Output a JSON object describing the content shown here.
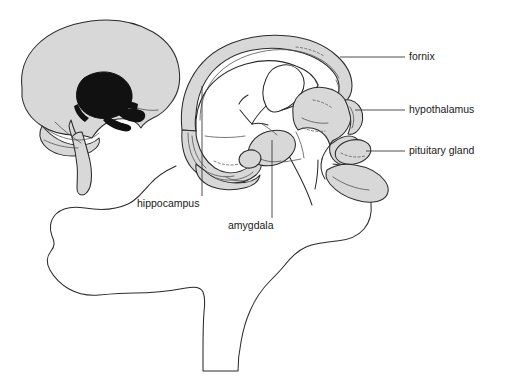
{
  "figure": {
    "background_color": "#ffffff",
    "width": 505,
    "height": 386,
    "shade_color": "#d8d8d8",
    "outline_color": "#2b2b2b",
    "leader_color": "#3a3a3a",
    "highlight_color": "#111111"
  },
  "labels": [
    {
      "id": "fornix",
      "text": "fornix",
      "x": 409,
      "y": 60,
      "leader_from_x": 340,
      "leader_from_y": 57,
      "leader_to_x": 405,
      "leader_to_y": 57
    },
    {
      "id": "hypothalamus",
      "text": "hypothalamus",
      "x": 409,
      "y": 113,
      "leader_from_x": 355,
      "leader_from_y": 110,
      "leader_to_x": 405,
      "leader_to_y": 110
    },
    {
      "id": "pituitary-gland",
      "text": "pituitary gland",
      "x": 409,
      "y": 154,
      "leader_from_x": 366,
      "leader_from_y": 151,
      "leader_to_x": 405,
      "leader_to_y": 151
    },
    {
      "id": "hippocampus",
      "text": "hippocampus",
      "x": 137,
      "y": 207,
      "leader_from_x": 202,
      "leader_from_y": 86,
      "leader_to_x": 202,
      "leader_to_y": 196
    },
    {
      "id": "amygdala",
      "text": "amygdala",
      "x": 228,
      "y": 229,
      "leader_from_x": 272,
      "leader_from_y": 140,
      "leader_to_x": 272,
      "leader_to_y": 218
    }
  ],
  "inset": {
    "id": "sagittal-brain-inset",
    "description": "small whole-brain sagittal silhouette with limbic ring highlighted in solid black"
  },
  "main": {
    "id": "limbic-system-detail",
    "description": "enlarged limbic structures: fornix arch, hippocampus, amygdala, thalamus/hypothalamus, pituitary gland, mammillary body"
  },
  "cerebrum": {
    "id": "cerebrum-brainstem-outline",
    "description": "large unshaded outline of cerebral hemisphere, cerebellum and brainstem"
  }
}
